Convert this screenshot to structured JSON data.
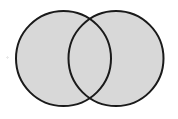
{
  "figure": {
    "kind": "venn-two-set",
    "canvas": {
      "width": 178,
      "height": 119
    },
    "background_color": "#ffffff",
    "fill_color": "#d8d8d8",
    "stroke_color": "#1a1a1a",
    "stroke_width": 2,
    "intersection_fill_color": "#d8d8d8",
    "intersection_shaded": false,
    "labels": [],
    "shapes": [
      {
        "name": "left-circle",
        "cx": 63.5,
        "cy": 58.5,
        "r": 47.5,
        "fill": "#d8d8d8",
        "stroke": "#1a1a1a"
      },
      {
        "name": "right-circle",
        "cx": 116.0,
        "cy": 58.5,
        "r": 47.5,
        "fill": "#d8d8d8",
        "stroke": "#1a1a1a"
      }
    ],
    "artifacts": [
      {
        "name": "scan-speck",
        "x": 6,
        "y": 56,
        "color": "#b9b9b9"
      }
    ]
  }
}
